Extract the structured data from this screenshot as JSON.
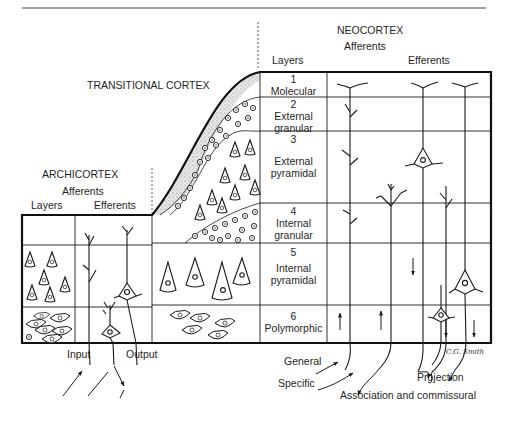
{
  "diagram": {
    "type": "cortical-layers-comparison",
    "regions": {
      "archicortex": {
        "title": "ARCHICORTEX",
        "afferents_label": "Afferents",
        "layers_label": "Layers",
        "efferents_label": "Efferents",
        "input_label": "Input",
        "output_label": "Output"
      },
      "transitional": {
        "title": "TRANSITIONAL CORTEX"
      },
      "neocortex": {
        "title": "NEOCORTEX",
        "afferents_label": "Afferents",
        "layers_label": "Layers",
        "efferents_label": "Efferents",
        "layers": [
          {
            "number": "1",
            "name": "Molecular"
          },
          {
            "number": "2",
            "name": "External granular"
          },
          {
            "number": "3",
            "name": "External pyramidal"
          },
          {
            "number": "4",
            "name": "Internal granular"
          },
          {
            "number": "5",
            "name": "Internal pyramidal"
          },
          {
            "number": "6",
            "name": "Polymorphic"
          }
        ],
        "layer_lines": [
          [
            "Molecular"
          ],
          [
            "External",
            "granular"
          ],
          [
            "External",
            "pyramidal"
          ],
          [
            "Internal",
            "granular"
          ],
          [
            "Internal",
            "pyramidal"
          ],
          [
            "Polymorphic"
          ]
        ],
        "fiber_labels": {
          "general": "General",
          "specific": "Specific",
          "association": "Association and commissural",
          "projection": "Projection"
        }
      }
    },
    "signature": "C.G. Smith"
  }
}
